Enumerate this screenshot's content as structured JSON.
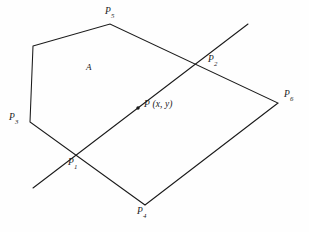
{
  "figure": {
    "background_color": "#fefefe",
    "stroke_color": "#1a1a1a",
    "labels": {
      "region": "A",
      "p1_base": "P",
      "p1_sub": "1",
      "p2_base": "P",
      "p2_sub": "2",
      "p3_base": "P",
      "p3_sub": "3",
      "p4_base": "P",
      "p4_sub": "4",
      "p5_base": "P",
      "p5_sub": "5",
      "p6_base": "P",
      "p6_sub": "6",
      "point_p": "P",
      "point_coords": "(x, y)"
    }
  },
  "chart_data": {
    "type": "diagram",
    "coordinate_space": {
      "width": 309,
      "height": 232,
      "origin": "top-left"
    },
    "polygon": {
      "name": "A",
      "closed": true,
      "vertices": [
        {
          "id": "v_upper_left",
          "label": "",
          "x": 33,
          "y": 46
        },
        {
          "id": "P5",
          "label": "P5",
          "x": 110,
          "y": 24
        },
        {
          "id": "P6",
          "label": "P6",
          "x": 278,
          "y": 103
        },
        {
          "id": "P4",
          "label": "P4",
          "x": 145,
          "y": 205
        },
        {
          "id": "P3",
          "label": "P3",
          "x": 30,
          "y": 122
        }
      ],
      "edges": [
        [
          "v_upper_left",
          "P5"
        ],
        [
          "P5",
          "P6"
        ],
        [
          "P6",
          "P4"
        ],
        [
          "P4",
          "P3"
        ],
        [
          "P3",
          "v_upper_left"
        ]
      ]
    },
    "transversal": {
      "id": "line-through-P",
      "start": {
        "x": 33,
        "y": 188
      },
      "end": {
        "x": 248,
        "y": 24
      },
      "intersections": [
        {
          "id": "P1",
          "label": "P1",
          "x": 75,
          "y": 157,
          "on_edge": "P3-P4"
        },
        {
          "id": "P2",
          "label": "P2",
          "x": 198,
          "y": 58,
          "on_edge": "P5-P6"
        }
      ]
    },
    "marked_point": {
      "id": "P",
      "label": "P (x, y)",
      "x": 138,
      "y": 108,
      "marker": "dot"
    },
    "label_positions": {
      "A": {
        "x": 87,
        "y": 68
      },
      "P5": {
        "x": 106,
        "y": 12
      },
      "P2": {
        "x": 209,
        "y": 60
      },
      "P6": {
        "x": 285,
        "y": 95
      },
      "P3": {
        "x": 10,
        "y": 118
      },
      "P1": {
        "x": 69,
        "y": 163
      },
      "P4": {
        "x": 138,
        "y": 212
      },
      "P_coords": {
        "x": 145,
        "y": 105
      }
    }
  }
}
